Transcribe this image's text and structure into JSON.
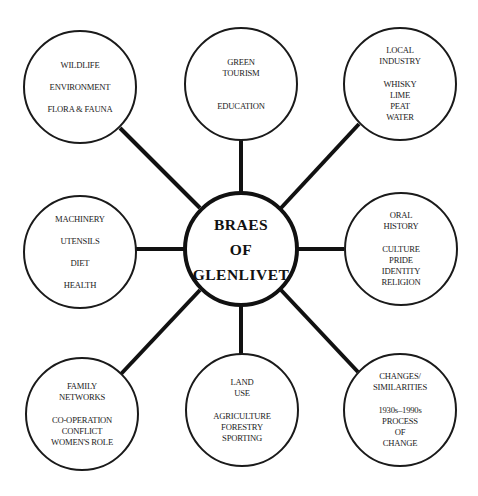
{
  "center": {
    "lines": [
      "BRAES",
      "OF",
      "GLENLIVET"
    ]
  },
  "nodes": {
    "top_left": {
      "lines": [
        "WILDLIFE",
        "ENVIRONMENT",
        "FLORA & FAUNA"
      ]
    },
    "top_center": {
      "heading": [
        "GREEN",
        "TOURISM"
      ],
      "items": [
        "EDUCATION"
      ]
    },
    "top_right": {
      "heading": [
        "LOCAL",
        "INDUSTRY"
      ],
      "items": [
        "WHISKY",
        "LIME",
        "PEAT",
        "WATER"
      ]
    },
    "mid_left": {
      "lines": [
        "MACHINERY",
        "UTENSILS",
        "DIET",
        "HEALTH"
      ]
    },
    "mid_right": {
      "heading": [
        "ORAL",
        "HISTORY"
      ],
      "items": [
        "CULTURE",
        "PRIDE",
        "IDENTITY",
        "RELIGION"
      ]
    },
    "bottom_left": {
      "heading": [
        "FAMILY",
        "NETWORKS"
      ],
      "items": [
        "CO-OPERATION",
        "CONFLICT",
        "WOMEN'S ROLE"
      ]
    },
    "bottom_center": {
      "heading": [
        "LAND",
        "USE"
      ],
      "items": [
        "AGRICULTURE",
        "FORESTRY",
        "SPORTING"
      ]
    },
    "bottom_right": {
      "heading": [
        "CHANGES/",
        "SIMILARITIES"
      ],
      "items": [
        "1930s–1990s",
        "PROCESS",
        "OF",
        "CHANGE"
      ]
    }
  },
  "colors": {
    "stroke": "#111111",
    "background": "#ffffff",
    "text": "#222222"
  }
}
